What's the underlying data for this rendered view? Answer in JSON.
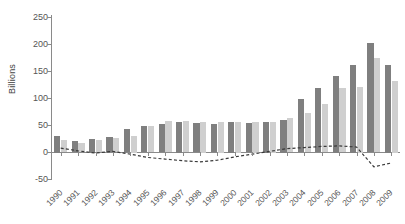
{
  "chart_data": {
    "type": "bar",
    "title": "",
    "xlabel": "",
    "ylabel": "Billions",
    "ylim": [
      -50,
      250
    ],
    "ytick_values": [
      250,
      200,
      150,
      100,
      50,
      0,
      -50
    ],
    "ytick_labels": [
      "250",
      "200",
      "150",
      "100",
      "50",
      "0",
      "-50"
    ],
    "grid": false,
    "legend_position": "none",
    "categories": [
      "1990",
      "1991",
      "1992",
      "1993",
      "1994",
      "1995",
      "1996",
      "1997",
      "1998",
      "1999",
      "2000",
      "2001",
      "2002",
      "2003",
      "2004",
      "2005",
      "2006",
      "2007",
      "2008",
      "2009"
    ],
    "series": [
      {
        "name": "series-dark",
        "style": "bar",
        "color": "#7f7f7f",
        "values": [
          30,
          21,
          25,
          28,
          42,
          48,
          52,
          55,
          53,
          52,
          55,
          53,
          55,
          60,
          97,
          117,
          140,
          160,
          199,
          160
        ]
      },
      {
        "name": "series-light",
        "style": "bar",
        "color": "#cfcfcf",
        "values": [
          22,
          18,
          22,
          26,
          30,
          48,
          57,
          57,
          55,
          55,
          55,
          55,
          55,
          62,
          72,
          88,
          118,
          120,
          172,
          130
        ]
      },
      {
        "name": "series-dashed",
        "style": "dashed-line",
        "color": "#3a3a3a",
        "values": [
          8,
          3,
          -1,
          2,
          -3,
          -9,
          -12,
          -15,
          -17,
          -14,
          -8,
          -3,
          2,
          7,
          9,
          11,
          12,
          10,
          -26,
          -19
        ]
      }
    ]
  }
}
